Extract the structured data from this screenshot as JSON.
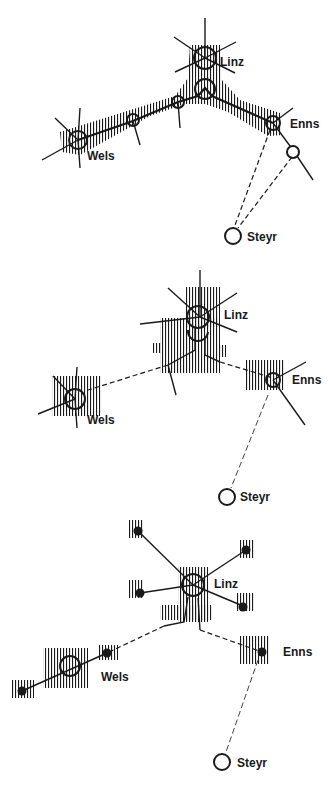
{
  "diagram": {
    "panels": [
      {
        "id": "panel-1",
        "labels": {
          "linz": "Linz",
          "wels": "Wels",
          "enns": "Enns",
          "steyr": "Steyr"
        }
      },
      {
        "id": "panel-2",
        "labels": {
          "linz": "Linz",
          "wels": "Wels",
          "enns": "Enns",
          "steyr": "Steyr"
        }
      },
      {
        "id": "panel-3",
        "labels": {
          "linz": "Linz",
          "wels": "Wels",
          "enns": "Enns",
          "steyr": "Steyr"
        }
      }
    ],
    "colors": {
      "ink": "#1a1a1a",
      "background": "#ffffff"
    }
  }
}
